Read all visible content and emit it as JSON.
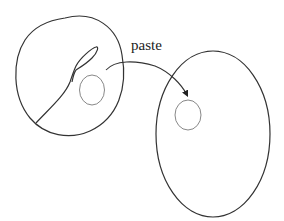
{
  "diagram": {
    "type": "topology-surgery-illustration",
    "arrow_label": "paste",
    "shapes": {
      "left_region": {
        "description": "closed irregular blob containing a curve with a teardrop loop and a small circle",
        "contains": [
          "curve-with-loop",
          "small-circle"
        ]
      },
      "right_region": {
        "description": "large ellipse containing a small circle",
        "contains": [
          "small-circle"
        ]
      }
    },
    "arrow": {
      "from": "left_region.small-circle",
      "to": "right_region.small-circle",
      "label": "paste"
    },
    "colors": {
      "outline": "#333333",
      "small_circle": "#888888",
      "background": "#ffffff"
    }
  }
}
